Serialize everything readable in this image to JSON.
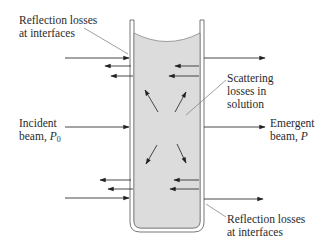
{
  "labels": {
    "reflection_top_line1": "Reflection losses",
    "reflection_top_line2": "at interfaces",
    "scattering_line1": "Scattering",
    "scattering_line2": "losses in",
    "scattering_line3": "solution",
    "incident_line1": "Incident",
    "incident_line2_prefix": "beam, ",
    "incident_symbol": "P",
    "incident_subscript": "0",
    "emergent_line1": "Emergent",
    "emergent_line2_prefix": "beam, ",
    "emergent_symbol": "P",
    "reflection_bottom_line1": "Reflection losses",
    "reflection_bottom_line2": "at interfaces"
  },
  "colors": {
    "solution_fill": "#dcdcdc",
    "line": "#333333",
    "wall": "#ffffff"
  }
}
